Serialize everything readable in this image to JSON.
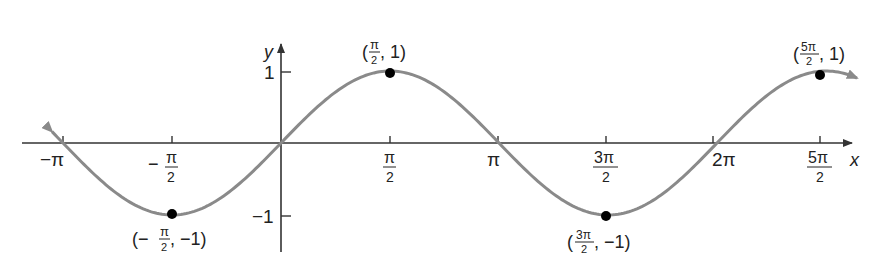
{
  "chart_data": {
    "type": "line",
    "title": "",
    "function": "y = sin x",
    "xlabel": "x",
    "ylabel": "y",
    "xlim": [
      -3.3,
      8.3
    ],
    "ylim": [
      -1.5,
      1.5
    ],
    "grid": false,
    "x_ticks": [
      {
        "value": -3.14159,
        "label": "−π"
      },
      {
        "value": -1.5708,
        "label": "−π/2"
      },
      {
        "value": 1.5708,
        "label": "π/2"
      },
      {
        "value": 3.14159,
        "label": "π"
      },
      {
        "value": 4.71239,
        "label": "3π/2"
      },
      {
        "value": 6.28319,
        "label": "2π"
      },
      {
        "value": 7.85398,
        "label": "5π/2"
      }
    ],
    "y_ticks": [
      {
        "value": 1,
        "label": "1"
      },
      {
        "value": -1,
        "label": "−1"
      }
    ],
    "curve_color": "#8a8a8a",
    "series": [
      {
        "name": "sin x",
        "x": [
          -3.3,
          -3.14159,
          -1.5708,
          0,
          1.5708,
          3.14159,
          4.71239,
          6.28319,
          7.85398,
          8.3
        ],
        "values": [
          0.158,
          0,
          -1,
          0,
          1,
          0,
          -1,
          0,
          1,
          0.902
        ]
      }
    ],
    "annotations": [
      {
        "x": -1.5708,
        "y": -1,
        "label": "(−π/2, −1)"
      },
      {
        "x": 1.5708,
        "y": 1,
        "label": "(π/2, 1)"
      },
      {
        "x": 4.71239,
        "y": -1,
        "label": "(3π/2, −1)"
      },
      {
        "x": 7.85398,
        "y": 1,
        "label": "(5π/2, 1)"
      }
    ]
  },
  "labels": {
    "x_axis": "x",
    "y_axis": "y",
    "tick_neg_pi": "−π",
    "neg": "−",
    "pi": "π",
    "two": "2",
    "three_pi": "3π",
    "two_pi": "2π",
    "five_pi": "5π",
    "one": "1",
    "neg_one": "−1",
    "pt1_open": "(−",
    "pt1_close": ", −1)",
    "pt2_open": "(",
    "pt2_close": ", 1)",
    "pt3_open": "(",
    "pt3_close": ", −1)",
    "pt4_open": "(",
    "pt4_close": ", 1)"
  }
}
